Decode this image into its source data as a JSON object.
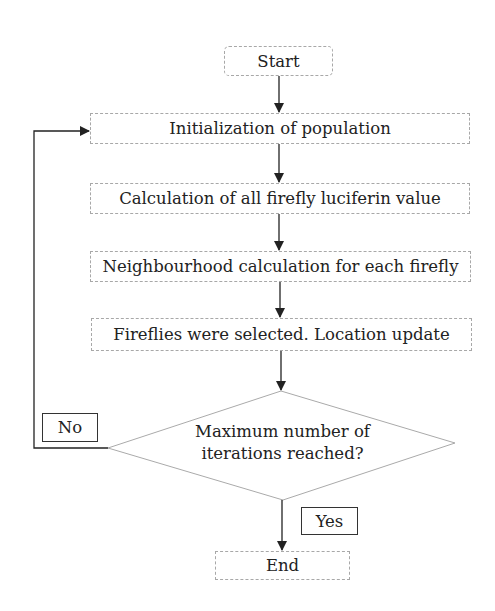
{
  "flowchart": {
    "nodes": {
      "start": {
        "label": "Start",
        "shape": "rounded-rect"
      },
      "init": {
        "label": "Initialization of population",
        "shape": "rect"
      },
      "calc": {
        "label": "Calculation of all firefly luciferin value",
        "shape": "rect"
      },
      "neigh": {
        "label": "Neighbourhood calculation for each firefly",
        "shape": "rect"
      },
      "select": {
        "label": "Fireflies were selected. Location update",
        "shape": "rect"
      },
      "decision": {
        "line1": "Maximum number of",
        "line2": "iterations reached?",
        "shape": "diamond"
      },
      "end": {
        "label": "End",
        "shape": "rect"
      }
    },
    "edge_labels": {
      "no": "No",
      "yes": "Yes"
    },
    "edges": [
      {
        "from": "start",
        "to": "init"
      },
      {
        "from": "init",
        "to": "calc"
      },
      {
        "from": "calc",
        "to": "neigh"
      },
      {
        "from": "neigh",
        "to": "select"
      },
      {
        "from": "select",
        "to": "decision"
      },
      {
        "from": "decision",
        "to": "init",
        "label": "No"
      },
      {
        "from": "decision",
        "to": "end",
        "label": "Yes"
      }
    ],
    "colors": {
      "box_border": "#a8a8a8",
      "arrow": "#222222",
      "label_border": "#333333"
    }
  }
}
